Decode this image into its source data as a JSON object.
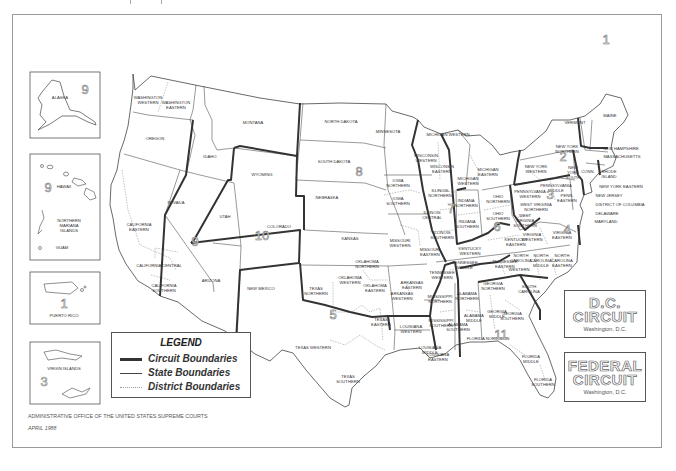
{
  "page": {
    "header_text": "Appendix"
  },
  "map": {
    "title": "Geographic Boundaries of United States Courts of Appeals and United States District Courts",
    "colors": {
      "circuit_line": "#333333",
      "state_line": "#444444",
      "district_line": "#999999",
      "frame": "#9a9a9a",
      "background": "#ffffff"
    },
    "circuit_numbers": [
      {
        "id": "1",
        "x": 606,
        "y": 44
      },
      {
        "id": "2",
        "x": 563,
        "y": 161
      },
      {
        "id": "3",
        "x": 550,
        "y": 199
      },
      {
        "id": "4",
        "x": 567,
        "y": 234
      },
      {
        "id": "5",
        "x": 333,
        "y": 319
      },
      {
        "id": "6",
        "x": 497,
        "y": 231
      },
      {
        "id": "7",
        "x": 451,
        "y": 213
      },
      {
        "id": "8",
        "x": 359,
        "y": 176
      },
      {
        "id": "9",
        "x": 195,
        "y": 246
      },
      {
        "id": "10",
        "x": 262,
        "y": 240
      },
      {
        "id": "11",
        "x": 501,
        "y": 339
      }
    ],
    "labels": [
      {
        "text": "WASHINGTON",
        "x": 148,
        "y": 99
      },
      {
        "text": "WESTERN",
        "x": 148,
        "y": 104
      },
      {
        "text": "WASHINGTON",
        "x": 176,
        "y": 104
      },
      {
        "text": "EASTERN",
        "x": 176,
        "y": 109
      },
      {
        "text": "OREGON",
        "x": 155,
        "y": 140
      },
      {
        "text": "IDAHO",
        "x": 210,
        "y": 158
      },
      {
        "text": "MONTANA",
        "x": 253,
        "y": 124
      },
      {
        "text": "WYOMING",
        "x": 262,
        "y": 176
      },
      {
        "text": "NORTH DAKOTA",
        "x": 341,
        "y": 123
      },
      {
        "text": "SOUTH DAKOTA",
        "x": 334,
        "y": 163
      },
      {
        "text": "NEBRASKA",
        "x": 327,
        "y": 199
      },
      {
        "text": "MINNESOTA",
        "x": 388,
        "y": 133
      },
      {
        "text": "NEVADA",
        "x": 176,
        "y": 204
      },
      {
        "text": "UTAH",
        "x": 225,
        "y": 218
      },
      {
        "text": "COLORADO",
        "x": 279,
        "y": 228
      },
      {
        "text": "KANSAS",
        "x": 350,
        "y": 240
      },
      {
        "text": "CALIFORNIA",
        "x": 139,
        "y": 226
      },
      {
        "text": "EASTERN",
        "x": 139,
        "y": 231
      },
      {
        "text": "CALIFORNIA CENTRAL",
        "x": 159,
        "y": 267
      },
      {
        "text": "CALIFORNIA",
        "x": 164,
        "y": 287
      },
      {
        "text": "SOUTHERN",
        "x": 164,
        "y": 292
      },
      {
        "text": "ARIZONA",
        "x": 211,
        "y": 282
      },
      {
        "text": "NEW MEXICO",
        "x": 261,
        "y": 290
      },
      {
        "text": "IOWA",
        "x": 398,
        "y": 182
      },
      {
        "text": "NORTHERN",
        "x": 398,
        "y": 187
      },
      {
        "text": "IOWA",
        "x": 398,
        "y": 200
      },
      {
        "text": "SOUTHERN",
        "x": 398,
        "y": 205
      },
      {
        "text": "WISCONSIN",
        "x": 426,
        "y": 157
      },
      {
        "text": "WESTERN",
        "x": 426,
        "y": 162
      },
      {
        "text": "WISCONSIN",
        "x": 442,
        "y": 168
      },
      {
        "text": "EASTERN",
        "x": 442,
        "y": 173
      },
      {
        "text": "MICHIGAN WESTERN",
        "x": 448,
        "y": 136
      },
      {
        "text": "MICHIGAN",
        "x": 468,
        "y": 180
      },
      {
        "text": "WESTERN",
        "x": 468,
        "y": 185
      },
      {
        "text": "MICHIGAN",
        "x": 488,
        "y": 171
      },
      {
        "text": "EASTERN",
        "x": 488,
        "y": 176
      },
      {
        "text": "ILLINOIS",
        "x": 440,
        "y": 192
      },
      {
        "text": "NORTHERN",
        "x": 440,
        "y": 197
      },
      {
        "text": "ILLINOIS",
        "x": 432,
        "y": 214
      },
      {
        "text": "CENTRAL",
        "x": 432,
        "y": 219
      },
      {
        "text": "ILLINOIS",
        "x": 442,
        "y": 234
      },
      {
        "text": "SOUTHERN",
        "x": 442,
        "y": 239
      },
      {
        "text": "INDIANA",
        "x": 466,
        "y": 202
      },
      {
        "text": "NORTHERN",
        "x": 466,
        "y": 207
      },
      {
        "text": "INDIANA",
        "x": 467,
        "y": 223
      },
      {
        "text": "SOUTHERN",
        "x": 467,
        "y": 228
      },
      {
        "text": "OHIO",
        "x": 498,
        "y": 198
      },
      {
        "text": "NORTHERN",
        "x": 498,
        "y": 203
      },
      {
        "text": "OHIO",
        "x": 498,
        "y": 215
      },
      {
        "text": "SOUTHERN",
        "x": 498,
        "y": 220
      },
      {
        "text": "MISSOURI",
        "x": 400,
        "y": 242
      },
      {
        "text": "WESTERN",
        "x": 400,
        "y": 247
      },
      {
        "text": "MISSOURI",
        "x": 430,
        "y": 251
      },
      {
        "text": "EASTERN",
        "x": 430,
        "y": 256
      },
      {
        "text": "KENTUCKY",
        "x": 516,
        "y": 241
      },
      {
        "text": "EASTERN",
        "x": 516,
        "y": 246
      },
      {
        "text": "KENTUCKY",
        "x": 470,
        "y": 250
      },
      {
        "text": "WESTERN",
        "x": 470,
        "y": 255
      },
      {
        "text": "TENNESSEE",
        "x": 465,
        "y": 264
      },
      {
        "text": "MIDDLE",
        "x": 465,
        "y": 269
      },
      {
        "text": "TENNESSEE",
        "x": 505,
        "y": 263
      },
      {
        "text": "EASTERN",
        "x": 505,
        "y": 268
      },
      {
        "text": "TENNESSEE",
        "x": 442,
        "y": 274
      },
      {
        "text": "WESTERN",
        "x": 442,
        "y": 279
      },
      {
        "text": "OKLAHOMA",
        "x": 367,
        "y": 263
      },
      {
        "text": "NORTHERN",
        "x": 367,
        "y": 268
      },
      {
        "text": "OKLAHOMA",
        "x": 350,
        "y": 279
      },
      {
        "text": "WESTERN",
        "x": 350,
        "y": 284
      },
      {
        "text": "OKLAHOMA",
        "x": 375,
        "y": 287
      },
      {
        "text": "EASTERN",
        "x": 375,
        "y": 292
      },
      {
        "text": "ARKANSAS",
        "x": 412,
        "y": 284
      },
      {
        "text": "EASTERN",
        "x": 412,
        "y": 289
      },
      {
        "text": "ARKANSAS",
        "x": 402,
        "y": 295
      },
      {
        "text": "WESTERN",
        "x": 402,
        "y": 300
      },
      {
        "text": "TEXAS",
        "x": 316,
        "y": 290
      },
      {
        "text": "NORTHERN",
        "x": 316,
        "y": 295
      },
      {
        "text": "TEXAS",
        "x": 381,
        "y": 321
      },
      {
        "text": "EASTERN",
        "x": 381,
        "y": 326
      },
      {
        "text": "TEXAS WESTERN",
        "x": 313,
        "y": 349
      },
      {
        "text": "TEXAS",
        "x": 348,
        "y": 378
      },
      {
        "text": "SOUTHERN",
        "x": 348,
        "y": 383
      },
      {
        "text": "LOUISIANA",
        "x": 411,
        "y": 328
      },
      {
        "text": "WESTERN",
        "x": 411,
        "y": 333
      },
      {
        "text": "LOUISIANA",
        "x": 430,
        "y": 349
      },
      {
        "text": "MIDDLE",
        "x": 430,
        "y": 354
      },
      {
        "text": "LOUISIANA",
        "x": 438,
        "y": 356
      },
      {
        "text": "EASTERN",
        "x": 438,
        "y": 361
      },
      {
        "text": "MISSISSIPPI",
        "x": 440,
        "y": 298
      },
      {
        "text": "NORTHERN",
        "x": 440,
        "y": 303
      },
      {
        "text": "MISSISSIPPI",
        "x": 441,
        "y": 322
      },
      {
        "text": "SOUTHERN",
        "x": 441,
        "y": 327
      },
      {
        "text": "ALABAMA",
        "x": 467,
        "y": 295
      },
      {
        "text": "NORTHERN",
        "x": 467,
        "y": 300
      },
      {
        "text": "ALABAMA",
        "x": 474,
        "y": 317
      },
      {
        "text": "MIDDLE",
        "x": 474,
        "y": 322
      },
      {
        "text": "ALABAMA",
        "x": 458,
        "y": 326
      },
      {
        "text": "SOUTHERN",
        "x": 458,
        "y": 331
      },
      {
        "text": "GEORGIA",
        "x": 493,
        "y": 285
      },
      {
        "text": "NORTHERN",
        "x": 493,
        "y": 290
      },
      {
        "text": "GEORGIA",
        "x": 497,
        "y": 313
      },
      {
        "text": "MIDDLE",
        "x": 497,
        "y": 318
      },
      {
        "text": "GEORGIA",
        "x": 512,
        "y": 315
      },
      {
        "text": "SOUTHERN",
        "x": 512,
        "y": 320
      },
      {
        "text": "FLORIDA NORTHERN",
        "x": 488,
        "y": 340
      },
      {
        "text": "FLORIDA",
        "x": 531,
        "y": 358
      },
      {
        "text": "MIDDLE",
        "x": 531,
        "y": 363
      },
      {
        "text": "FLORIDA",
        "x": 543,
        "y": 381
      },
      {
        "text": "SOUTHERN",
        "x": 543,
        "y": 386
      },
      {
        "text": "SOUTH",
        "x": 529,
        "y": 288
      },
      {
        "text": "CAROLINA",
        "x": 529,
        "y": 293
      },
      {
        "text": "NORTH",
        "x": 521,
        "y": 257
      },
      {
        "text": "CAROLINA",
        "x": 521,
        "y": 262
      },
      {
        "text": "WESTERN",
        "x": 519,
        "y": 271
      },
      {
        "text": "NORTH",
        "x": 541,
        "y": 257
      },
      {
        "text": "CAROLINA",
        "x": 541,
        "y": 262
      },
      {
        "text": "MIDDLE",
        "x": 541,
        "y": 267
      },
      {
        "text": "NORTH",
        "x": 562,
        "y": 257
      },
      {
        "text": "CAROLINA",
        "x": 562,
        "y": 262
      },
      {
        "text": "EASTERN",
        "x": 562,
        "y": 267
      },
      {
        "text": "VIRGINIA",
        "x": 532,
        "y": 236
      },
      {
        "text": "WESTERN",
        "x": 532,
        "y": 241
      },
      {
        "text": "VIRGINIA",
        "x": 562,
        "y": 234
      },
      {
        "text": "EASTERN",
        "x": 562,
        "y": 239
      },
      {
        "text": "WEST",
        "x": 525,
        "y": 217
      },
      {
        "text": "VIRGINIA",
        "x": 525,
        "y": 222
      },
      {
        "text": "SOUTHERN",
        "x": 525,
        "y": 227
      },
      {
        "text": "WEST VIRGINIA",
        "x": 536,
        "y": 206
      },
      {
        "text": "NORTHERN",
        "x": 536,
        "y": 211
      },
      {
        "text": "PENNSYLVANIA",
        "x": 530,
        "y": 193
      },
      {
        "text": "WESTERN",
        "x": 530,
        "y": 198
      },
      {
        "text": "PENNSYLVANIA",
        "x": 556,
        "y": 187
      },
      {
        "text": "MIDDLE",
        "x": 556,
        "y": 192
      },
      {
        "text": "PENN.",
        "x": 567,
        "y": 197
      },
      {
        "text": "EASTERN",
        "x": 567,
        "y": 202
      },
      {
        "text": "NEW YORK",
        "x": 536,
        "y": 168
      },
      {
        "text": "WESTERN",
        "x": 536,
        "y": 173
      },
      {
        "text": "NEW YORK",
        "x": 567,
        "y": 148
      },
      {
        "text": "NORTHERN",
        "x": 567,
        "y": 153
      },
      {
        "text": "NEW",
        "x": 573,
        "y": 169
      },
      {
        "text": "YORK",
        "x": 573,
        "y": 174
      },
      {
        "text": "SOUTH",
        "x": 573,
        "y": 179
      },
      {
        "text": "CONN.",
        "x": 588,
        "y": 173
      },
      {
        "text": "VERMONT",
        "x": 575,
        "y": 124
      },
      {
        "text": "MAINE",
        "x": 610,
        "y": 117
      },
      {
        "text": "NEW HAMPSHIRE",
        "x": 621,
        "y": 150
      },
      {
        "text": "MASSACHUSETTS",
        "x": 622,
        "y": 158
      },
      {
        "text": "RHODE",
        "x": 609,
        "y": 173
      },
      {
        "text": "ISLAND",
        "x": 609,
        "y": 178
      },
      {
        "text": "NEW YORK EASTERN",
        "x": 621,
        "y": 188
      },
      {
        "text": "NEW JERSEY",
        "x": 609,
        "y": 197
      },
      {
        "text": "DISTRICT OF COLUMBIA",
        "x": 620,
        "y": 206
      },
      {
        "text": "DELAWARE",
        "x": 607,
        "y": 215
      },
      {
        "text": "MARYLAND",
        "x": 606,
        "y": 223
      }
    ]
  },
  "insets": {
    "alaska": {
      "label": "ALASKA",
      "circuit": "9"
    },
    "hawaii": {
      "label": "HAWAII",
      "circuit": "9",
      "extra_labels": [
        "NORTHERN",
        "MARIANA",
        "ISLANDS"
      ],
      "guam_label": "GUAM"
    },
    "puerto_rico": {
      "label": "PUERTO RICO",
      "circuit": "1"
    },
    "virgin_islands": {
      "label": "VIRGIN ISLANDS",
      "circuit": "3"
    }
  },
  "legend": {
    "title": "LEGEND",
    "items": [
      {
        "label": "Circuit Boundaries",
        "style": "thick"
      },
      {
        "label": "State Boundaries",
        "style": "thin"
      },
      {
        "label": "District Boundaries",
        "style": "dotted"
      }
    ]
  },
  "special_circuits": [
    {
      "title_line1": "D.C.",
      "title_line2": "CIRCUIT",
      "location": "Washington, D.C."
    },
    {
      "title_line1": "FEDERAL",
      "title_line2": "CIRCUIT",
      "location": "Washington, D.C."
    }
  ],
  "footer": {
    "line1": "ADMINISTRATIVE OFFICE OF THE UNITED STATES SUPREME COURTS",
    "line2": "APRIL 1988"
  }
}
